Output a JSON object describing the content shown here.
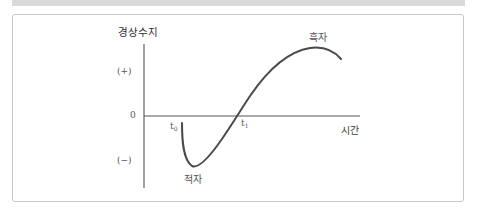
{
  "diagram": {
    "y_axis_label": "경상수지",
    "x_axis_label": "시간",
    "y_ticks": {
      "positive": "(+)",
      "zero": "0",
      "negative": "(−)"
    },
    "time_points": {
      "t0": {
        "base": "t",
        "sub": "0"
      },
      "t1": {
        "base": "t",
        "sub": "1"
      }
    },
    "annotations": {
      "deficit": "적자",
      "surplus": "흑자"
    },
    "colors": {
      "curve": "#4a4a4a",
      "axis": "#555555",
      "frame": "#c8c8c8",
      "top_band": "#d9d9d9"
    }
  }
}
